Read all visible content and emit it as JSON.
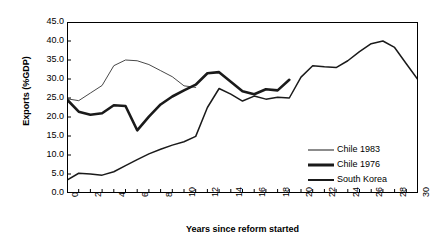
{
  "chart_data": {
    "type": "line",
    "title": "",
    "xlabel": "Years since reform started",
    "ylabel": "Exports (%GDP)",
    "xlim": [
      0,
      30
    ],
    "ylim": [
      0,
      45
    ],
    "xticks": [
      0,
      1,
      2,
      3,
      4,
      5,
      6,
      7,
      8,
      9,
      10,
      11,
      12,
      13,
      14,
      15,
      16,
      17,
      18,
      19,
      20,
      21,
      22,
      23,
      24,
      25,
      26,
      27,
      28,
      29,
      30
    ],
    "xticklabels": [
      "0",
      "",
      "2",
      "",
      "4",
      "",
      "6",
      "",
      "8",
      "",
      "10",
      "",
      "12",
      "",
      "14",
      "",
      "16",
      "",
      "18",
      "",
      "20",
      "",
      "22",
      "",
      "24",
      "",
      "26",
      "",
      "28",
      "",
      "30"
    ],
    "yticks": [
      0,
      5,
      10,
      15,
      20,
      25,
      30,
      35,
      40,
      45
    ],
    "yticklabels": [
      "0.0",
      "5.0",
      "10.0",
      "15.0",
      "20.0",
      "25.0",
      "30.0",
      "35.0",
      "40.0",
      "45.0"
    ],
    "grid": false,
    "legend_position": "center-right",
    "series": [
      {
        "name": "Chile 1983",
        "linewidth": 0.8,
        "color": "#1a1a1a",
        "x": [
          0,
          1,
          2,
          3,
          4,
          5,
          6,
          7,
          8,
          9,
          10,
          11
        ],
        "values": [
          24.8,
          24.3,
          26.3,
          28.3,
          33.5,
          35.0,
          34.8,
          33.8,
          32.2,
          30.6,
          28.2,
          27.8
        ]
      },
      {
        "name": "Chile 1976",
        "linewidth": 2.6,
        "color": "#1a1a1a",
        "x": [
          0,
          1,
          2,
          3,
          4,
          5,
          6,
          7,
          8,
          9,
          10,
          11,
          12,
          13,
          14,
          15,
          16,
          17,
          18,
          19
        ],
        "values": [
          24.6,
          21.4,
          20.6,
          21.0,
          23.1,
          22.9,
          16.5,
          20.1,
          23.3,
          25.4,
          27.0,
          28.5,
          31.5,
          31.8,
          29.3,
          26.8,
          26.0,
          27.3,
          27.0,
          29.8
        ]
      },
      {
        "name": "South Korea",
        "linewidth": 1.5,
        "color": "#1a1a1a",
        "x": [
          0,
          1,
          2,
          3,
          4,
          5,
          6,
          7,
          8,
          9,
          10,
          11,
          12,
          13,
          14,
          15,
          16,
          17,
          18,
          19,
          20,
          21,
          22,
          23,
          24,
          25,
          26,
          27,
          28,
          29,
          30
        ],
        "values": [
          3.4,
          5.2,
          5.0,
          4.7,
          5.6,
          7.2,
          8.8,
          10.3,
          11.5,
          12.6,
          13.5,
          14.9,
          22.5,
          27.5,
          26.0,
          24.2,
          25.5,
          24.7,
          25.2,
          25.0,
          30.5,
          33.5,
          33.2,
          33.0,
          34.8,
          37.2,
          39.3,
          40.0,
          38.3,
          34.0,
          29.8
        ]
      }
    ]
  },
  "legend": {
    "items": [
      {
        "label": "Chile 1983",
        "thickness": 1
      },
      {
        "label": "Chile 1976",
        "thickness": 3
      },
      {
        "label": "South Korea",
        "thickness": 2
      }
    ]
  }
}
